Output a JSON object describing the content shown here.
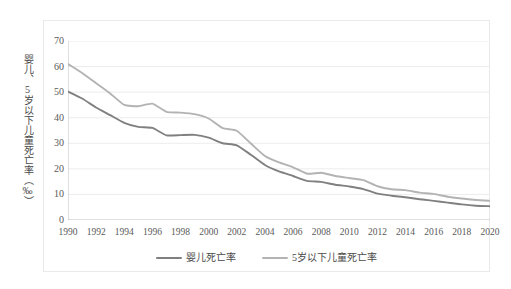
{
  "chart_data": {
    "type": "line",
    "title": "",
    "xlabel": "",
    "ylabel": "婴儿、5岁以下儿童死亡率（‰）",
    "xlim": [
      1990,
      2020
    ],
    "ylim": [
      0,
      70
    ],
    "ytick_step": 10,
    "xtick_step": 2,
    "grid": true,
    "legend_position": "bottom-center",
    "yticks": [
      "70",
      "60",
      "50",
      "40",
      "30",
      "20",
      "10",
      "0"
    ],
    "x": [
      1990,
      1991,
      1992,
      1993,
      1994,
      1995,
      1996,
      1997,
      1998,
      1999,
      2000,
      2001,
      2002,
      2003,
      2004,
      2005,
      2006,
      2007,
      2008,
      2009,
      2010,
      2011,
      2012,
      2013,
      2014,
      2015,
      2016,
      2017,
      2018,
      2019,
      2020
    ],
    "xticks": [
      "1990",
      "1992",
      "1994",
      "1996",
      "1998",
      "2000",
      "2002",
      "2004",
      "2006",
      "2008",
      "2010",
      "2012",
      "2014",
      "2016",
      "2018",
      "2020"
    ],
    "series": [
      {
        "name": "婴儿死亡率",
        "color": "#808080",
        "values": [
          50.2,
          47.5,
          44.0,
          41.0,
          38.0,
          36.4,
          36.0,
          33.1,
          33.2,
          33.3,
          32.2,
          30.0,
          29.2,
          25.5,
          21.5,
          19.0,
          17.2,
          15.3,
          14.9,
          13.8,
          13.1,
          12.1,
          10.3,
          9.5,
          8.9,
          8.1,
          7.5,
          6.8,
          6.1,
          5.6,
          5.4
        ]
      },
      {
        "name": "5岁以下儿童死亡率",
        "color": "#b3b3b3",
        "values": [
          61.0,
          57.5,
          53.5,
          49.5,
          45.0,
          44.5,
          45.5,
          42.3,
          42.0,
          41.4,
          39.7,
          35.9,
          34.9,
          29.9,
          25.0,
          22.5,
          20.6,
          18.1,
          18.5,
          17.2,
          16.4,
          15.6,
          13.2,
          12.0,
          11.7,
          10.7,
          10.2,
          9.1,
          8.4,
          7.8,
          7.5
        ]
      }
    ]
  },
  "legend": {
    "items": [
      {
        "label": "婴儿死亡率",
        "color": "#808080"
      },
      {
        "label": "5岁以下儿童死亡率",
        "color": "#b3b3b3"
      }
    ]
  },
  "colors": {
    "grid": "#ececec",
    "axis": "#bfbfbf",
    "frame": "#e9e9e9",
    "tick_text": "#595959",
    "axis_title_text": "#4a4a4a",
    "background": "#ffffff"
  }
}
